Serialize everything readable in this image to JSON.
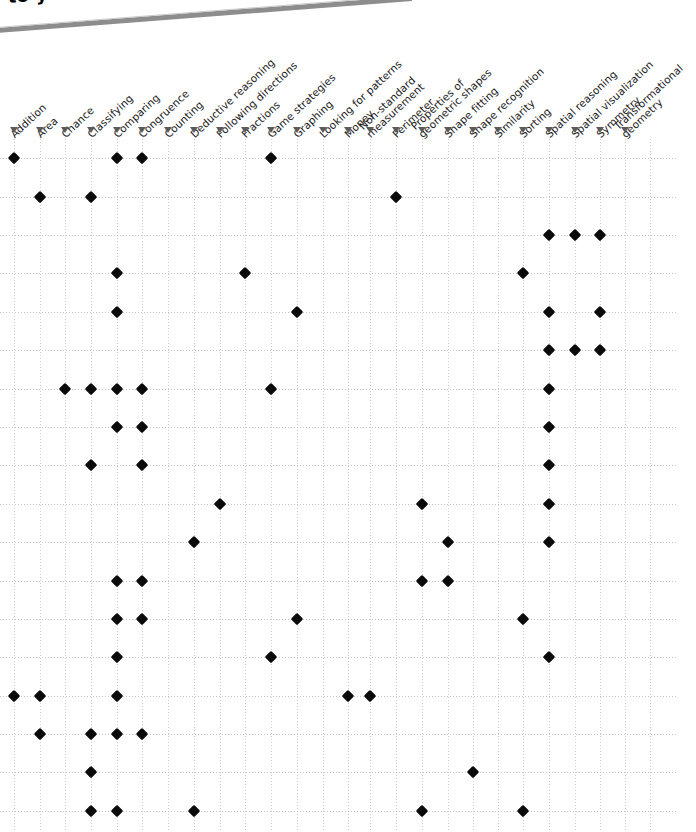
{
  "banner": {
    "line1": "the Super S",
    "line2": "to your curriculum."
  },
  "grid": {
    "marker_icon": "diamond-marker",
    "arrow_icon": "triangle-down-icon",
    "marker_color": "#0a0a0a",
    "gridline_color": "#c2c2c2",
    "column_count": 26,
    "row_count": 18,
    "col_x": [
      14,
      40,
      65,
      91,
      117,
      142,
      168,
      194,
      220,
      245,
      271,
      297,
      323,
      348,
      370,
      396,
      422,
      448,
      473,
      498,
      523,
      549,
      575,
      600,
      625,
      650
    ],
    "row_y": [
      19,
      58,
      96,
      134,
      173,
      211,
      250,
      288,
      326,
      365,
      403,
      442,
      480,
      518,
      557,
      595,
      633,
      672
    ]
  },
  "columns": [
    {
      "label": "Addition"
    },
    {
      "label": "Area"
    },
    {
      "label": "Chance"
    },
    {
      "label": "Classifying"
    },
    {
      "label": "Comparing"
    },
    {
      "label": "Congruence"
    },
    {
      "label": "Counting"
    },
    {
      "label": "Deductive reasoning"
    },
    {
      "label": "Following directions"
    },
    {
      "label": "Fractions"
    },
    {
      "label": "Game strategies"
    },
    {
      "label": "Graphing"
    },
    {
      "label": "Looking for patterns"
    },
    {
      "label": "Money"
    },
    {
      "label": "Non-standard measurement"
    },
    {
      "label": "Perimeter"
    },
    {
      "label": "Properties of geometric shapes"
    },
    {
      "label": "Shape fitting"
    },
    {
      "label": "Shape recognition"
    },
    {
      "label": "Similarity"
    },
    {
      "label": "Sorting"
    },
    {
      "label": "Spatial reasoning"
    },
    {
      "label": "Spatial visualization"
    },
    {
      "label": "Symmetry"
    },
    {
      "label": "Transformational geometry"
    }
  ],
  "chart_data": {
    "type": "heatmap",
    "xlabel": "",
    "ylabel": "",
    "grid": true,
    "legend": "none",
    "categories": [
      "Addition",
      "Area",
      "Chance",
      "Classifying",
      "Comparing",
      "Congruence",
      "Counting",
      "Deductive reasoning",
      "Following directions",
      "Fractions",
      "Game strategies",
      "Graphing",
      "Looking for patterns",
      "Money",
      "Non-standard measurement",
      "Perimeter",
      "Properties of geometric shapes",
      "Shape fitting",
      "Shape recognition",
      "Similarity",
      "Sorting",
      "Spatial reasoning",
      "Spatial visualization",
      "Symmetry",
      "Transformational geometry"
    ],
    "rows": [
      {
        "row": 1,
        "marked": [
          "Addition",
          "Comparing",
          "Congruence",
          "Game strategies"
        ]
      },
      {
        "row": 2,
        "marked": [
          "Area",
          "Classifying",
          "Perimeter"
        ]
      },
      {
        "row": 3,
        "marked": [
          "Spatial reasoning",
          "Spatial visualization",
          "Symmetry"
        ]
      },
      {
        "row": 4,
        "marked": [
          "Comparing",
          "Fractions",
          "Sorting"
        ]
      },
      {
        "row": 5,
        "marked": [
          "Comparing",
          "Graphing",
          "Spatial reasoning",
          "Symmetry"
        ]
      },
      {
        "row": 6,
        "marked": [
          "Spatial reasoning",
          "Spatial visualization",
          "Symmetry"
        ]
      },
      {
        "row": 7,
        "marked": [
          "Chance",
          "Classifying",
          "Comparing",
          "Congruence",
          "Game strategies",
          "Spatial reasoning"
        ]
      },
      {
        "row": 8,
        "marked": [
          "Comparing",
          "Congruence",
          "Spatial reasoning"
        ]
      },
      {
        "row": 9,
        "marked": [
          "Classifying",
          "Congruence",
          "Spatial reasoning"
        ]
      },
      {
        "row": 10,
        "marked": [
          "Following directions",
          "Properties of geometric shapes",
          "Spatial reasoning"
        ]
      },
      {
        "row": 11,
        "marked": [
          "Deductive reasoning",
          "Shape fitting",
          "Spatial reasoning"
        ]
      },
      {
        "row": 12,
        "marked": [
          "Comparing",
          "Congruence",
          "Properties of geometric shapes",
          "Shape fitting"
        ]
      },
      {
        "row": 13,
        "marked": [
          "Comparing",
          "Congruence",
          "Graphing",
          "Sorting"
        ]
      },
      {
        "row": 14,
        "marked": [
          "Comparing",
          "Game strategies",
          "Spatial reasoning"
        ]
      },
      {
        "row": 15,
        "marked": [
          "Addition",
          "Area",
          "Comparing",
          "Money",
          "Non-standard measurement"
        ]
      },
      {
        "row": 16,
        "marked": [
          "Area",
          "Classifying",
          "Comparing",
          "Congruence"
        ]
      },
      {
        "row": 17,
        "marked": [
          "Classifying",
          "Shape recognition"
        ]
      },
      {
        "row": 18,
        "marked": [
          "Classifying",
          "Comparing",
          "Deductive reasoning",
          "Properties of geometric shapes",
          "Sorting"
        ]
      }
    ]
  }
}
